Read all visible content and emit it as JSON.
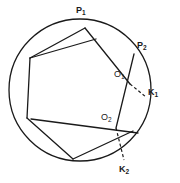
{
  "figure": {
    "type": "geometry-diagram",
    "background_color": "#ffffff",
    "stroke_color": "#1a1a1a",
    "canvas": {
      "width": 180,
      "height": 183
    }
  },
  "circle": {
    "name": "circumscribed-circle",
    "cx": 80,
    "cy": 90,
    "r": 71,
    "stroke_width": 1.3
  },
  "hexagon": {
    "name": "inscribed-hexagon",
    "vertices": [
      {
        "id": "v1",
        "x": 85,
        "y": 28
      },
      {
        "id": "v2",
        "x": 30,
        "y": 58
      },
      {
        "id": "v3",
        "x": 27,
        "y": 118
      },
      {
        "id": "v4",
        "x": 73,
        "y": 159
      },
      {
        "id": "v5",
        "x": 133,
        "y": 131
      },
      {
        "id": "v6",
        "x": 136,
        "y": 56
      }
    ],
    "stroke_width": 1.3
  },
  "chords": [
    {
      "name": "chord-p1-k1",
      "x1": 85,
      "y1": 28,
      "x2": 130,
      "y2": 84,
      "dashed": false
    },
    {
      "name": "chord-o1-k1-dashed",
      "x1": 130,
      "y1": 84,
      "x2": 146,
      "y2": 97,
      "dashed": true
    },
    {
      "name": "chord-p2-lower",
      "x1": 134,
      "y1": 54,
      "x2": 116,
      "y2": 128,
      "dashed": false
    },
    {
      "name": "chord-o2-k2-dashed",
      "x1": 116,
      "y1": 128,
      "x2": 124,
      "y2": 160,
      "dashed": true
    },
    {
      "name": "chord-left-upper",
      "x1": 30,
      "y1": 58,
      "x2": 96,
      "y2": 39,
      "dashed": false
    },
    {
      "name": "chord-lower-right",
      "x1": 31,
      "y1": 119,
      "x2": 138,
      "y2": 133,
      "dashed": false
    }
  ],
  "labels": [
    {
      "name": "label-p1",
      "base": "P",
      "sub": "1",
      "x": 76,
      "y": 6,
      "style": "bold"
    },
    {
      "name": "label-p2",
      "base": "P",
      "sub": "2",
      "x": 137,
      "y": 41,
      "style": "bold"
    },
    {
      "name": "label-k1",
      "base": "K",
      "sub": "1",
      "x": 148,
      "y": 88,
      "style": "bold"
    },
    {
      "name": "label-o1",
      "base": "O",
      "sub": "1",
      "x": 114,
      "y": 70,
      "style": "regular"
    },
    {
      "name": "label-o2",
      "base": "O",
      "sub": "2",
      "x": 101,
      "y": 113,
      "style": "regular"
    },
    {
      "name": "label-k2",
      "base": "K",
      "sub": "2",
      "x": 119,
      "y": 165,
      "style": "bold"
    }
  ]
}
